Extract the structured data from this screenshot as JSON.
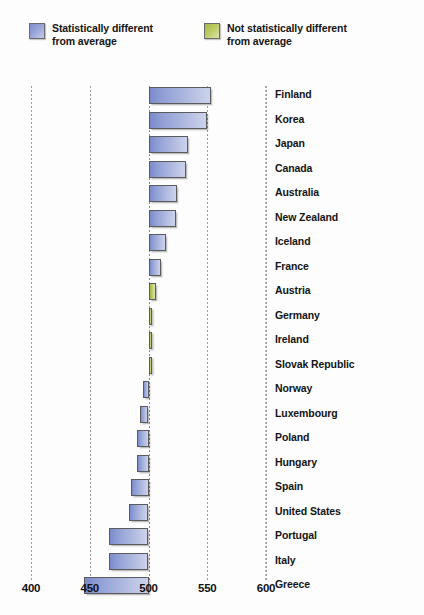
{
  "legend": {
    "items": [
      {
        "swatch": "blue-swatch",
        "color": "#97a3d8",
        "label": "Statistically different\nfrom average"
      },
      {
        "swatch": "green-swatch",
        "color": "#bccb63",
        "label": "Not statistically different\nfrom average"
      }
    ]
  },
  "chart_data": {
    "type": "bar",
    "orientation": "horizontal",
    "title": "",
    "subtitle": "",
    "xlabel": "",
    "ylabel": "",
    "xlim": [
      400,
      600
    ],
    "baseline": 500,
    "grid": true,
    "gridlines": [
      400,
      450,
      500,
      550,
      600
    ],
    "xticks": [
      "400",
      "450",
      "500",
      "550",
      "600"
    ],
    "legend_position": "top",
    "series": [
      {
        "name": "Statistically different from average",
        "color": "#97a3d8"
      },
      {
        "name": "Not statistically different from average",
        "color": "#bccb63"
      }
    ],
    "categories": [
      "Finland",
      "Korea",
      "Japan",
      "Canada",
      "Australia",
      "New Zealand",
      "Iceland",
      "France",
      "Austria",
      "Germany",
      "Ireland",
      "Slovak Republic",
      "Norway",
      "Luxembourg",
      "Poland",
      "Hungary",
      "Spain",
      "United States",
      "Portugal",
      "Italy",
      "Greece"
    ],
    "points": [
      {
        "label": "Finland",
        "value": 553,
        "significance": "different"
      },
      {
        "label": "Korea",
        "value": 550,
        "significance": "different"
      },
      {
        "label": "Japan",
        "value": 534,
        "significance": "different"
      },
      {
        "label": "Canada",
        "value": 532,
        "significance": "different"
      },
      {
        "label": "Australia",
        "value": 524,
        "significance": "different"
      },
      {
        "label": "New Zealand",
        "value": 523,
        "significance": "different"
      },
      {
        "label": "Iceland",
        "value": 515,
        "significance": "different"
      },
      {
        "label": "France",
        "value": 511,
        "significance": "different"
      },
      {
        "label": "Austria",
        "value": 506,
        "significance": "not-different"
      },
      {
        "label": "Germany",
        "value": 503,
        "significance": "not-different"
      },
      {
        "label": "Ireland",
        "value": 503,
        "significance": "not-different"
      },
      {
        "label": "Slovak Republic",
        "value": 501,
        "significance": "not-different"
      },
      {
        "label": "Norway",
        "value": 495,
        "significance": "different"
      },
      {
        "label": "Luxembourg",
        "value": 493,
        "significance": "different"
      },
      {
        "label": "Poland",
        "value": 490,
        "significance": "different"
      },
      {
        "label": "Hungary",
        "value": 490,
        "significance": "different"
      },
      {
        "label": "Spain",
        "value": 485,
        "significance": "different"
      },
      {
        "label": "United States",
        "value": 483,
        "significance": "different"
      },
      {
        "label": "Portugal",
        "value": 466,
        "significance": "different"
      },
      {
        "label": "Italy",
        "value": 466,
        "significance": "different"
      },
      {
        "label": "Greece",
        "value": 445,
        "significance": "different"
      }
    ]
  }
}
